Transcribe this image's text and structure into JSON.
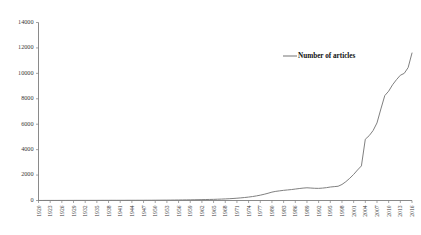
{
  "chart_data": {
    "type": "line",
    "title": "",
    "subtitle": "",
    "xlabel": "",
    "ylabel": "",
    "ylim": [
      0,
      14000
    ],
    "xlim": [
      1920,
      2016
    ],
    "grid": false,
    "legend_position": "top-right",
    "legend": [
      "Number of articles"
    ],
    "series_color": "#808080",
    "y_ticks": [
      0,
      2000,
      4000,
      6000,
      8000,
      10000,
      12000,
      14000
    ],
    "y_tick_labels": [
      "0",
      "2000",
      "4000",
      "6000",
      "8000",
      "10000",
      "12000",
      "14000"
    ],
    "x_tick_labels": [
      "1920",
      "1923",
      "1926",
      "1929",
      "1932",
      "1935",
      "1938",
      "1941",
      "1944",
      "1947",
      "1950",
      "1953",
      "1956",
      "1959",
      "1962",
      "1965",
      "1968",
      "1971",
      "1974",
      "1977",
      "1980",
      "1983",
      "1986",
      "1989",
      "1992",
      "1995",
      "1998",
      "2001",
      "2004",
      "2007",
      "2010",
      "2013",
      "2016"
    ],
    "x_tick_step": 3,
    "series": [
      {
        "name": "Number of articles",
        "x": [
          1920,
          1921,
          1922,
          1923,
          1924,
          1925,
          1926,
          1927,
          1928,
          1929,
          1930,
          1931,
          1932,
          1933,
          1934,
          1935,
          1936,
          1937,
          1938,
          1939,
          1940,
          1941,
          1942,
          1943,
          1944,
          1945,
          1946,
          1947,
          1948,
          1949,
          1950,
          1951,
          1952,
          1953,
          1954,
          1955,
          1956,
          1957,
          1958,
          1959,
          1960,
          1961,
          1962,
          1963,
          1964,
          1965,
          1966,
          1967,
          1968,
          1969,
          1970,
          1971,
          1972,
          1973,
          1974,
          1975,
          1976,
          1977,
          1978,
          1979,
          1980,
          1981,
          1982,
          1983,
          1984,
          1985,
          1986,
          1987,
          1988,
          1989,
          1990,
          1991,
          1992,
          1993,
          1994,
          1995,
          1996,
          1997,
          1998,
          1999,
          2000,
          2001,
          2002,
          2003,
          2004,
          2005,
          2006,
          2007,
          2008,
          2009,
          2010,
          2011,
          2012,
          2013,
          2014,
          2015,
          2016
        ],
        "values": [
          5,
          5,
          6,
          6,
          7,
          7,
          8,
          8,
          9,
          9,
          10,
          10,
          11,
          11,
          12,
          12,
          13,
          14,
          14,
          15,
          15,
          16,
          16,
          17,
          18,
          18,
          19,
          20,
          21,
          22,
          24,
          26,
          28,
          30,
          33,
          36,
          40,
          44,
          48,
          53,
          58,
          64,
          70,
          76,
          83,
          90,
          100,
          112,
          125,
          140,
          158,
          180,
          205,
          235,
          270,
          310,
          360,
          420,
          490,
          570,
          660,
          720,
          760,
          800,
          830,
          860,
          900,
          940,
          975,
          1000,
          980,
          960,
          955,
          975,
          1010,
          1060,
          1090,
          1120,
          1260,
          1480,
          1750,
          2050,
          2400,
          2720,
          4820,
          5100,
          5500,
          6100,
          7200,
          8250,
          8600,
          9100,
          9500,
          9850,
          10000,
          10450,
          11600
        ]
      }
    ]
  },
  "legend": {
    "label": "Number of articles"
  }
}
